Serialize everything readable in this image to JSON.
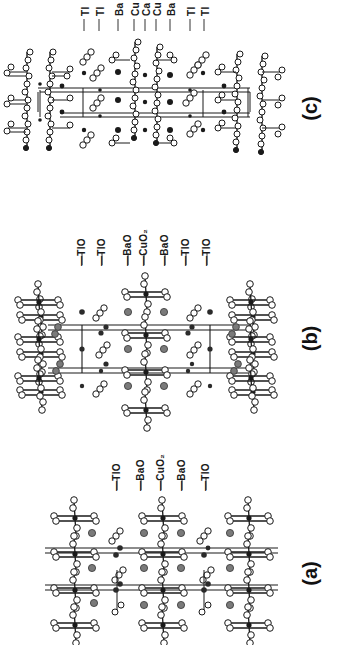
{
  "figure": {
    "panels": [
      {
        "id": "a",
        "letter": "(a)",
        "layers": [
          "TlO",
          "BaO",
          "CuO2",
          "BaO",
          "TlO"
        ],
        "layer_display": [
          "—TlO",
          "—BaO",
          "—CuO₂",
          "—BaO",
          "—TlO"
        ]
      },
      {
        "id": "b",
        "letter": "(b)",
        "layers": [
          "TlO",
          "TlO",
          "BaO",
          "CuO2",
          "BaO",
          "TlO",
          "TlO"
        ],
        "layer_display": [
          "—TlO",
          "—TlO",
          "—BaO",
          "—CuO₂",
          "—BaO",
          "—TlO",
          "—TlO"
        ]
      },
      {
        "id": "c",
        "letter": "(c)",
        "layers": [
          "Tl",
          "Tl",
          "Ba",
          "Cu",
          "Ca",
          "Cu",
          "Ba",
          "Tl",
          "Tl"
        ],
        "layer_display": [
          "Tl",
          "Tl",
          "Ba",
          "Cu",
          "Ca",
          "Cu",
          "Ba",
          "Tl",
          "Tl"
        ]
      }
    ],
    "colors": {
      "background": "#ffffff",
      "bond": "#1a1a1a",
      "oxygen_fill": "#ffffff",
      "cu_atom": "#1a1a1a",
      "ba_atom": "#7a7a7a",
      "tl_atom": "#2a2a2a"
    }
  }
}
